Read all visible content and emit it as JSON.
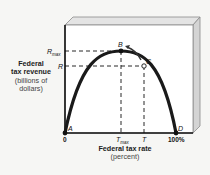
{
  "diagram": {
    "type": "laffer-curve",
    "y_axis": {
      "title_line1": "Federal",
      "title_line2": "tax revenue",
      "unit_line1": "(billions of",
      "unit_line2": "dollars)",
      "ticks": [
        {
          "label": "R",
          "sub": "max"
        },
        {
          "label": "R",
          "sub": ""
        }
      ]
    },
    "x_axis": {
      "title": "Federal tax rate",
      "unit": "(percent)",
      "ticks": [
        {
          "label": "0",
          "sub": ""
        },
        {
          "label": "T",
          "sub": "max"
        },
        {
          "label": "T",
          "sub": ""
        },
        {
          "label": "100%",
          "sub": ""
        }
      ]
    },
    "points": [
      {
        "label": "A",
        "desc": "0% tax rate, zero revenue"
      },
      {
        "label": "B",
        "desc": "Tmax, Rmax (maximum revenue)"
      },
      {
        "label": "C",
        "desc": "T, R"
      },
      {
        "label": "D",
        "desc": "100% tax rate, zero revenue"
      }
    ],
    "arrow": "from C toward B",
    "colors": {
      "curve": "#1a1a1a",
      "box_front": "#ffffff",
      "box_side": "#d9d9d9",
      "box_top": "#e6e6e6"
    }
  }
}
